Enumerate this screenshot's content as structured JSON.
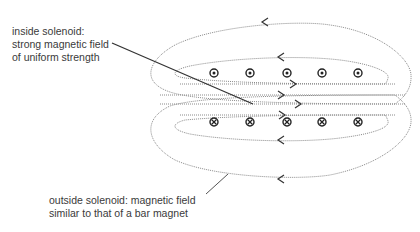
{
  "diagram": {
    "labels": {
      "inside": {
        "lines": [
          "inside solenoid:",
          "strong magnetic field",
          "of uniform strength"
        ]
      },
      "outside": {
        "lines": [
          "outside solenoid: magnetic field",
          "similar to that of a bar magnet"
        ]
      }
    },
    "conductors": {
      "top_row": {
        "symbol": "dot (current out of page)",
        "count": 5,
        "x": [
          214,
          250,
          287,
          322,
          358
        ],
        "y": 73
      },
      "bottom_row": {
        "symbol": "cross (current into page)",
        "count": 5,
        "x": [
          214,
          250,
          287,
          322,
          358
        ],
        "y": 122
      }
    },
    "field_arrows": {
      "top_outer": "left",
      "top_inner": "left",
      "center": [
        "right",
        "right",
        "right",
        "right"
      ],
      "bottom_inner": "left",
      "bottom_outer": "left"
    },
    "colors": {
      "field_line": "#8a8a8a",
      "leader": "#333333",
      "text": "#3a3a3a",
      "symbol": "#222222",
      "background": "#ffffff"
    }
  }
}
